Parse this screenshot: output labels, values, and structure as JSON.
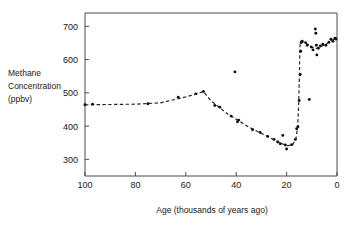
{
  "figure": {
    "background": "#ffffff",
    "ink_color": "#1a1a1a"
  },
  "labels": {
    "y_axis_line1": "Methane",
    "y_axis_line2": "Concentration",
    "y_axis_line3": "(ppbv)",
    "x_axis_title": "Age  (thousands of years ago)"
  },
  "chart_data": {
    "type": "scatter",
    "title": "",
    "xlabel": "Age  (thousands of years ago)",
    "ylabel": "Methane Concentration (ppbv)",
    "xlim": [
      100,
      0
    ],
    "ylim": [
      250,
      740
    ],
    "x_reversed": true,
    "grid": false,
    "legend": null,
    "xticks": [
      100,
      80,
      60,
      40,
      20,
      0
    ],
    "xticklabels": [
      "100",
      "80",
      "60",
      "40",
      "20",
      "0"
    ],
    "yticks": [
      300,
      400,
      500,
      600,
      700
    ],
    "yticklabels": [
      "300",
      "400",
      "500",
      "600",
      "700"
    ],
    "series": [
      {
        "name": "Methane concentration measurements",
        "marker": "filled-circle",
        "color": "#111111",
        "points": [
          [
            100.0,
            464
          ],
          [
            97.0,
            466
          ],
          [
            75.0,
            467
          ],
          [
            63.0,
            487
          ],
          [
            56.0,
            497
          ],
          [
            53.0,
            504
          ],
          [
            48.5,
            462
          ],
          [
            46.5,
            457
          ],
          [
            42.0,
            430
          ],
          [
            40.5,
            563
          ],
          [
            39.5,
            413
          ],
          [
            39.0,
            418
          ],
          [
            33.5,
            389
          ],
          [
            30.5,
            381
          ],
          [
            27.5,
            369
          ],
          [
            25.0,
            360
          ],
          [
            23.5,
            352
          ],
          [
            22.5,
            347
          ],
          [
            21.5,
            372
          ],
          [
            20.5,
            343
          ],
          [
            20.0,
            331
          ],
          [
            18.0,
            344
          ],
          [
            16.5,
            360
          ],
          [
            16.0,
            392
          ],
          [
            15.5,
            398
          ],
          [
            15.0,
            477
          ],
          [
            14.6,
            555
          ],
          [
            14.4,
            625
          ],
          [
            14.2,
            651
          ],
          [
            13.8,
            655
          ],
          [
            12.5,
            651
          ],
          [
            11.8,
            643
          ],
          [
            11.0,
            480
          ],
          [
            10.2,
            638
          ],
          [
            9.5,
            629
          ],
          [
            8.6,
            692
          ],
          [
            8.4,
            679
          ],
          [
            8.2,
            643
          ],
          [
            8.0,
            614
          ],
          [
            7.4,
            634
          ],
          [
            6.6,
            641
          ],
          [
            5.6,
            646
          ],
          [
            4.4,
            643
          ],
          [
            3.2,
            652
          ],
          [
            2.4,
            661
          ],
          [
            1.6,
            655
          ],
          [
            0.8,
            664
          ],
          [
            0.4,
            662
          ]
        ]
      }
    ],
    "trend_line": {
      "name": "fitted dashed trend",
      "style": "dashed",
      "color": "#1f1f1f",
      "points": [
        [
          100.0,
          464
        ],
        [
          90.0,
          465
        ],
        [
          80.0,
          466
        ],
        [
          70.0,
          470
        ],
        [
          62.0,
          484
        ],
        [
          56.0,
          496
        ],
        [
          53.0,
          504
        ],
        [
          50.0,
          476
        ],
        [
          47.0,
          458
        ],
        [
          43.0,
          434
        ],
        [
          39.0,
          416
        ],
        [
          35.0,
          397
        ],
        [
          31.0,
          382
        ],
        [
          27.0,
          367
        ],
        [
          24.0,
          355
        ],
        [
          21.5,
          346
        ],
        [
          19.5,
          341
        ],
        [
          17.5,
          345
        ],
        [
          16.3,
          362
        ],
        [
          15.6,
          398
        ],
        [
          15.2,
          470
        ],
        [
          14.9,
          560
        ],
        [
          14.7,
          640
        ],
        [
          14.5,
          655
        ],
        [
          13.0,
          652
        ],
        [
          11.5,
          645
        ],
        [
          10.0,
          637
        ],
        [
          8.5,
          633
        ],
        [
          7.0,
          636
        ],
        [
          5.5,
          643
        ],
        [
          4.0,
          648
        ],
        [
          2.5,
          656
        ],
        [
          1.0,
          661
        ],
        [
          0.0,
          664
        ]
      ]
    },
    "annotations": [
      {
        "text": "sharp rise at deglaciation",
        "x": 15,
        "y": 500,
        "visible": false
      }
    ]
  }
}
